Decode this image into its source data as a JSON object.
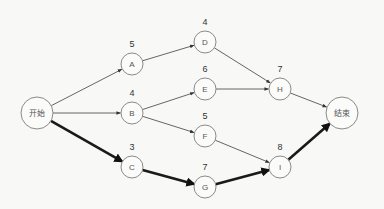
{
  "diagram": {
    "type": "network-diagram",
    "nodes": [
      {
        "id": "start",
        "label": "开始",
        "duration": null,
        "x": 37,
        "y": 113,
        "r": 16,
        "terminal": true
      },
      {
        "id": "A",
        "label": "A",
        "duration": "5",
        "x": 132,
        "y": 64,
        "r": 11
      },
      {
        "id": "B",
        "label": "B",
        "duration": "4",
        "x": 132,
        "y": 113,
        "r": 11
      },
      {
        "id": "C",
        "label": "C",
        "duration": "3",
        "x": 132,
        "y": 167,
        "r": 11
      },
      {
        "id": "D",
        "label": "D",
        "duration": "4",
        "x": 205,
        "y": 42,
        "r": 11
      },
      {
        "id": "E",
        "label": "E",
        "duration": "6",
        "x": 205,
        "y": 89,
        "r": 11
      },
      {
        "id": "F",
        "label": "F",
        "duration": "5",
        "x": 205,
        "y": 136,
        "r": 11
      },
      {
        "id": "G",
        "label": "G",
        "duration": "7",
        "x": 205,
        "y": 187,
        "r": 11
      },
      {
        "id": "H",
        "label": "H",
        "duration": "7",
        "x": 280,
        "y": 89,
        "r": 11
      },
      {
        "id": "I",
        "label": "I",
        "duration": "8",
        "x": 280,
        "y": 167,
        "r": 11
      },
      {
        "id": "end",
        "label": "结束",
        "duration": null,
        "x": 342,
        "y": 113,
        "r": 16,
        "terminal": true
      }
    ],
    "edges": [
      {
        "from": "start",
        "to": "A",
        "critical": false
      },
      {
        "from": "start",
        "to": "B",
        "critical": false
      },
      {
        "from": "start",
        "to": "C",
        "critical": true
      },
      {
        "from": "A",
        "to": "D",
        "critical": false
      },
      {
        "from": "B",
        "to": "E",
        "critical": false
      },
      {
        "from": "B",
        "to": "F",
        "critical": false
      },
      {
        "from": "C",
        "to": "G",
        "critical": true
      },
      {
        "from": "D",
        "to": "H",
        "critical": false
      },
      {
        "from": "E",
        "to": "H",
        "critical": false
      },
      {
        "from": "F",
        "to": "I",
        "critical": false
      },
      {
        "from": "G",
        "to": "I",
        "critical": true
      },
      {
        "from": "H",
        "to": "end",
        "critical": false
      },
      {
        "from": "I",
        "to": "end",
        "critical": true
      }
    ],
    "critical_path": [
      "开始",
      "C",
      "G",
      "I",
      "结束"
    ]
  },
  "colors": {
    "background": "#f8f8f6",
    "node_stroke": "#8a8a8a",
    "thin_edge": "#555555",
    "critical_edge": "#1a1a1a"
  }
}
